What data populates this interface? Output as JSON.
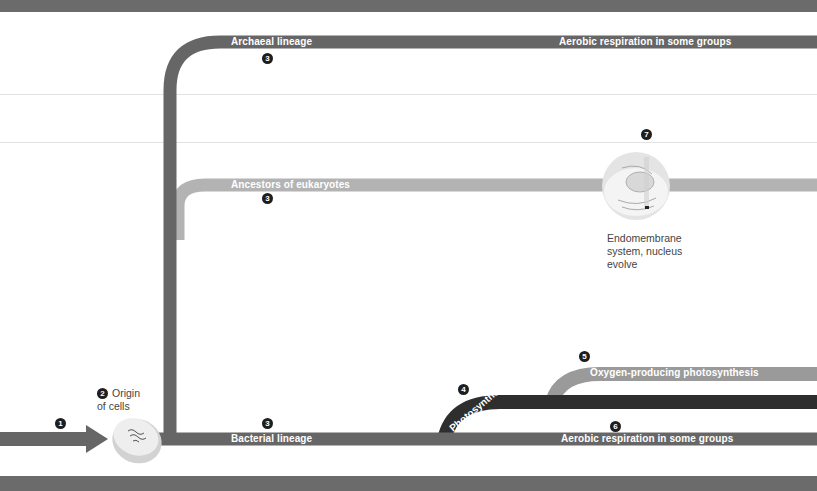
{
  "colors": {
    "archaeal": "#666666",
    "eukaryote_ancestors": "#b3b3b3",
    "bacterial": "#666666",
    "photosynthesis": "#2e2e2e",
    "oxygen_photosynthesis": "#9a9a9a",
    "band": "#6b6b6b",
    "marker": "#1e1e1e"
  },
  "lineages": {
    "archaeal": {
      "label": "Archaeal lineage",
      "marker": "3",
      "trait": "Aerobic respiration in some groups"
    },
    "eukaryote_ancestors": {
      "label": "Ancestors of eukaryotes",
      "marker": "3"
    },
    "bacterial": {
      "label": "Bacterial lineage",
      "marker": "3",
      "trait": "Aerobic respiration in some groups",
      "trait_marker": "6"
    },
    "photosynthesis": {
      "label": "Photosynthesis",
      "marker": "4"
    },
    "oxygen_photosynthesis": {
      "label": "Oxygen-producing photosynthesis",
      "marker": "5"
    }
  },
  "events": {
    "start": {
      "marker": "1"
    },
    "origin": {
      "marker": "2",
      "line1": "Origin",
      "line2": "of cells"
    },
    "nucleus": {
      "marker": "7",
      "line1": "Endomembrane",
      "line2": "system, nucleus",
      "line3": "evolve"
    }
  }
}
